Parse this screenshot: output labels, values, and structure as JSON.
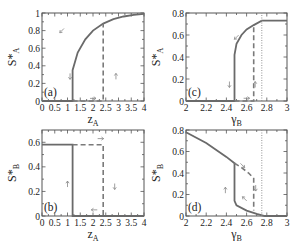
{
  "chart_data": [
    {
      "id": "a",
      "type": "line",
      "panel_label": "(a)",
      "xlabel": "z_A",
      "ylabel": "S*_A",
      "xlim": [
        0,
        4
      ],
      "ylim": [
        0,
        1
      ],
      "xticks": [
        "0",
        "0.5",
        "1",
        "1.5",
        "2",
        "2.5",
        "3",
        "3.5",
        "4"
      ],
      "yticks": [
        "0",
        "0.2",
        "0.4",
        "0.6",
        "0.8",
        "1"
      ],
      "series": [
        {
          "name": "backward (solid)",
          "style": "solid",
          "x": [
            0,
            1.2,
            1.2,
            1.4,
            1.7,
            2.0,
            2.4,
            2.8,
            3.2,
            3.6,
            4.0
          ],
          "y": [
            0,
            0,
            0.35,
            0.55,
            0.7,
            0.8,
            0.88,
            0.93,
            0.96,
            0.98,
            0.99
          ]
        },
        {
          "name": "forward (dashed)",
          "style": "dashed",
          "x": [
            1.2,
            2.4,
            2.4
          ],
          "y": [
            0,
            0,
            0.88
          ]
        }
      ],
      "annotations": [
        "arrow-down-left on curve",
        "arrow-down at z=1",
        "arrow-right at S=0",
        "arrow-up at z=2.5"
      ]
    },
    {
      "id": "b",
      "type": "line",
      "panel_label": "(b)",
      "xlabel": "z_A",
      "ylabel": "S*_B",
      "xlim": [
        0,
        4
      ],
      "ylim": [
        0,
        0.7
      ],
      "xticks": [
        "0",
        "0.5",
        "1",
        "1.5",
        "2",
        "2.5",
        "3",
        "3.5",
        "4"
      ],
      "yticks": [
        "0",
        "0.2",
        "0.4",
        "0.6"
      ],
      "series": [
        {
          "name": "backward (solid)",
          "style": "solid",
          "x": [
            0,
            1.2,
            1.2,
            4.0
          ],
          "y": [
            0.58,
            0.58,
            0,
            0
          ]
        },
        {
          "name": "forward (dashed)",
          "style": "dashed",
          "x": [
            1.2,
            2.4,
            2.4
          ],
          "y": [
            0.58,
            0.58,
            0
          ]
        }
      ],
      "annotations": [
        "arrow-right at S=0.6",
        "arrow-up at z=1",
        "arrow-down at z=2.6",
        "arrow-left at S=0"
      ]
    },
    {
      "id": "c",
      "type": "line",
      "panel_label": "(c)",
      "xlabel": "γ_B",
      "ylabel": "S*_A",
      "xlim": [
        2,
        3
      ],
      "ylim": [
        0,
        0.8
      ],
      "xticks": [
        "2",
        "2.2",
        "2.4",
        "2.6",
        "2.8",
        "3"
      ],
      "yticks": [
        "0",
        "0.2",
        "0.4",
        "0.6",
        "0.8"
      ],
      "series": [
        {
          "name": "backward (solid)",
          "style": "solid",
          "x": [
            2.0,
            2.48,
            2.48,
            2.5,
            2.55,
            2.6,
            2.67,
            2.75,
            3.0
          ],
          "y": [
            0,
            0,
            0.42,
            0.52,
            0.6,
            0.65,
            0.69,
            0.73,
            0.73
          ]
        },
        {
          "name": "forward (dashed)",
          "style": "dashed",
          "x": [
            2.48,
            2.67,
            2.67
          ],
          "y": [
            0,
            0,
            0.69
          ]
        },
        {
          "name": "threshold (dotted)",
          "style": "dotted",
          "x": [
            2.75,
            2.75
          ],
          "y": [
            0,
            0.8
          ]
        }
      ],
      "annotations": [
        "arrow-down-left on curve",
        "arrow-down at γ=2.43",
        "arrow-right at S=0",
        "arrows up at γ=2.68"
      ]
    },
    {
      "id": "d",
      "type": "line",
      "panel_label": "(d)",
      "xlabel": "γ_B",
      "ylabel": "S*_B",
      "xlim": [
        2,
        3
      ],
      "ylim": [
        0,
        0.8
      ],
      "xticks": [
        "2",
        "2.2",
        "2.4",
        "2.6",
        "2.8",
        "3"
      ],
      "yticks": [
        "0",
        "0.2",
        "0.4",
        "0.6",
        "0.8"
      ],
      "series": [
        {
          "name": "backward (solid)",
          "style": "solid",
          "x": [
            2.0,
            2.2,
            2.4,
            2.48,
            2.48,
            2.5,
            2.6,
            2.7,
            2.78,
            3.0
          ],
          "y": [
            0.78,
            0.68,
            0.55,
            0.49,
            0.14,
            0.1,
            0.05,
            0.02,
            0,
            0
          ]
        },
        {
          "name": "forward (dashed)",
          "style": "dashed",
          "x": [
            2.48,
            2.55,
            2.62,
            2.67,
            2.67
          ],
          "y": [
            0.49,
            0.45,
            0.4,
            0.35,
            0.05
          ]
        },
        {
          "name": "threshold (dotted)",
          "style": "dotted",
          "x": [
            2.75,
            2.75
          ],
          "y": [
            0,
            0.8
          ]
        }
      ],
      "annotations": [
        "arrow-down-right at S=0.45",
        "arrow-up at γ=2.4",
        "arrows down at γ=2.69",
        "arrow-up-left at S=0.15"
      ]
    }
  ],
  "labels": {
    "a": "(a)",
    "b": "(b)",
    "c": "(c)",
    "d": "(d)",
    "ylabel_top_S": "S",
    "ylabel_top_sub": "A",
    "ylabel_bottom_sub": "B",
    "xlabel_z": "z",
    "xlabel_z_sub": "A",
    "xlabel_gamma": "γ",
    "xlabel_gamma_sub": "B"
  }
}
